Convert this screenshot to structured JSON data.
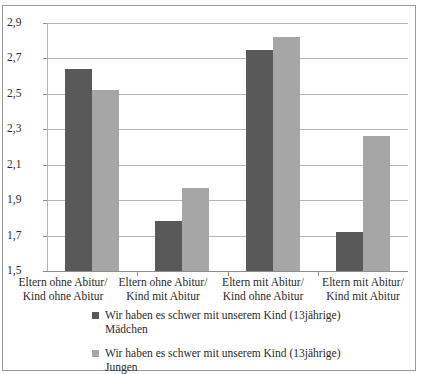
{
  "chart_data": {
    "type": "bar",
    "title": "",
    "subtitle": "",
    "xlabel": "",
    "ylabel": "",
    "ylim": [
      1.5,
      2.9
    ],
    "grid": true,
    "grid_axis": "y",
    "legend_position": "bottom",
    "categories": [
      "Eltern ohne Abitur/ Kind ohne Abitur",
      "Eltern ohne Abitur/ Kind mit Abitur",
      "Eltern mit Abitur/ Kind ohne Abitur",
      "Eltern mit Abitur/ Kind mit Abitur"
    ],
    "category_lines": [
      [
        "Eltern ohne Abitur/",
        "Kind ohne Abitur"
      ],
      [
        "Eltern ohne Abitur/",
        "Kind mit Abitur"
      ],
      [
        "Eltern mit Abitur/",
        "Kind ohne Abitur"
      ],
      [
        "Eltern mit Abitur/",
        "Kind mit Abitur"
      ]
    ],
    "ytick_labels": [
      "2,9",
      "2,7",
      "2,5",
      "2,3",
      "2,1",
      "1,9",
      "1,7",
      "1,5"
    ],
    "ytick_values": [
      2.9,
      2.7,
      2.5,
      2.3,
      2.1,
      1.9,
      1.7,
      1.5
    ],
    "series": [
      {
        "name": "Wir haben es schwer mit unserem Kind (13jährige) Mädchen",
        "name_lines": [
          "Wir haben es schwer mit unserem Kind (13jährige)",
          "Mädchen"
        ],
        "color": "#595959",
        "values": [
          2.64,
          1.78,
          2.75,
          1.72
        ]
      },
      {
        "name": "Wir haben es schwer mit unserem Kind (13jährige) Jungen",
        "name_lines": [
          "Wir haben es schwer mit unserem Kind (13jährige)",
          "Jungen"
        ],
        "color": "#a6a6a6",
        "values": [
          2.52,
          1.97,
          2.82,
          2.26
        ]
      }
    ]
  },
  "style": {
    "frame_color": "#9a9a9a",
    "grid_color": "#b6b6b6",
    "axis_color": "#8d8d8d",
    "text_color": "#2b2b2b",
    "background": "#ffffff"
  }
}
